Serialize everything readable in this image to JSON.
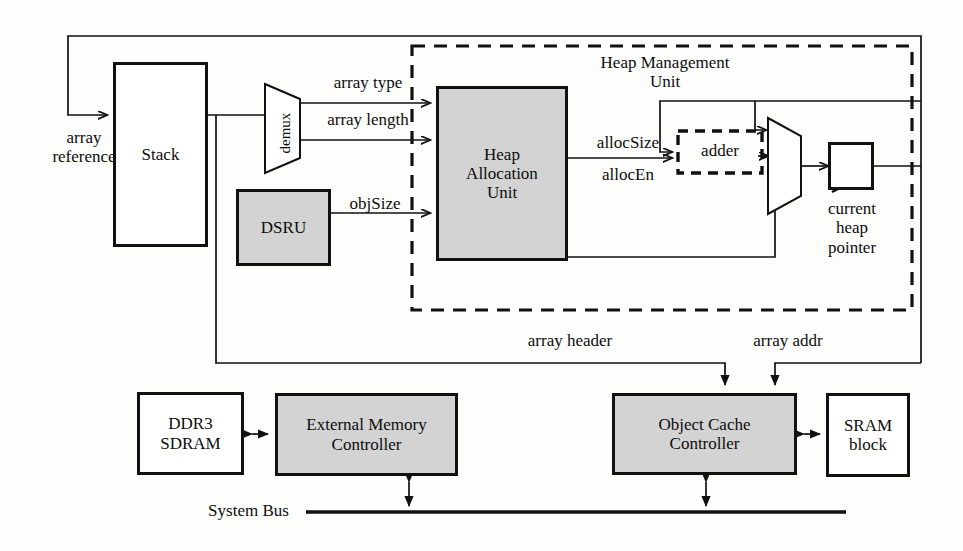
{
  "diagram": {
    "colors": {
      "line": "#111111",
      "shaded_fill": "#d3d3d3",
      "plain_fill": "#ffffff",
      "text": "#0d0d0d"
    },
    "group_boxes": [
      {
        "id": "hmu",
        "label": "Heap Management Unit",
        "style": "dashed"
      },
      {
        "id": "adder",
        "label": "adder",
        "style": "dashed"
      }
    ],
    "blocks": [
      {
        "id": "stack",
        "label": "Stack",
        "fill": "plain"
      },
      {
        "id": "dsru",
        "label": "DSRU",
        "fill": "shaded"
      },
      {
        "id": "hau",
        "label": "Heap\nAllocation\nUnit",
        "fill": "shaded"
      },
      {
        "id": "chp_reg",
        "label": "",
        "fill": "plain"
      },
      {
        "id": "ddr3",
        "label": "DDR3\nSDRAM",
        "fill": "plain"
      },
      {
        "id": "emc",
        "label": "External Memory\nController",
        "fill": "shaded"
      },
      {
        "id": "occ",
        "label": "Object Cache\nController",
        "fill": "shaded"
      },
      {
        "id": "sram",
        "label": "SRAM\nblock",
        "fill": "plain"
      }
    ],
    "shapes": [
      {
        "id": "demux",
        "label": "demux",
        "kind": "trapezoid",
        "rotated_text": true
      },
      {
        "id": "mux",
        "label": "",
        "kind": "trapezoid",
        "rotated_text": false
      }
    ],
    "free_labels": [
      {
        "id": "array-reference",
        "text": "array\nreference"
      },
      {
        "id": "array-type",
        "text": "array type"
      },
      {
        "id": "array-length",
        "text": "array length"
      },
      {
        "id": "obj-size",
        "text": "objSize"
      },
      {
        "id": "alloc-size",
        "text": "allocSize"
      },
      {
        "id": "alloc-en",
        "text": "allocEn"
      },
      {
        "id": "current-heap-pointer",
        "text": "current\nheap\npointer"
      },
      {
        "id": "array-header",
        "text": "array header"
      },
      {
        "id": "array-addr",
        "text": "array addr"
      },
      {
        "id": "system-bus",
        "text": "System Bus"
      }
    ],
    "signals": [
      "array reference",
      "array type",
      "array length",
      "objSize",
      "allocSize",
      "allocEn",
      "array header",
      "array addr"
    ]
  }
}
